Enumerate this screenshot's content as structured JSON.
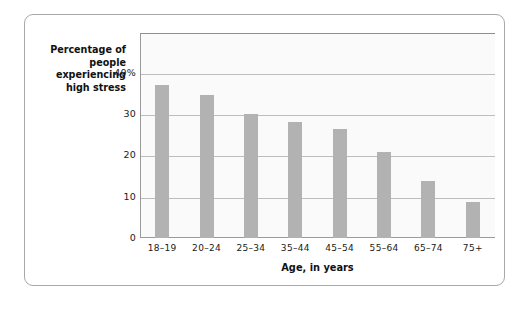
{
  "chart_data": {
    "type": "bar",
    "title": "",
    "xlabel": "Age, in years",
    "ylabel": "Percentage of people experiencing high stress",
    "ylabel_lines": [
      "Percentage of",
      "people",
      "experiencing",
      "high stress"
    ],
    "categories": [
      "18–19",
      "20–24",
      "25–34",
      "35–44",
      "45–54",
      "55–64",
      "65–74",
      "75+"
    ],
    "values": [
      37.0,
      34.6,
      30.0,
      28.0,
      26.4,
      20.7,
      13.9,
      8.6
    ],
    "ytick_labels": [
      "0",
      "10",
      "20",
      "30",
      "40%"
    ],
    "ytick_values": [
      0,
      10,
      20,
      30,
      40
    ],
    "ylim": [
      0,
      49.6
    ],
    "xlim_note": "categorical",
    "grid": "horizontal",
    "legend": "none",
    "bar_color": "#b2b2b2",
    "gridline_color": "#bdbdbd",
    "plot_background": "#fafafa",
    "axis_color": "#9a9a9a",
    "card_border_color": "#a8a8a8",
    "text_color": "#111111"
  }
}
